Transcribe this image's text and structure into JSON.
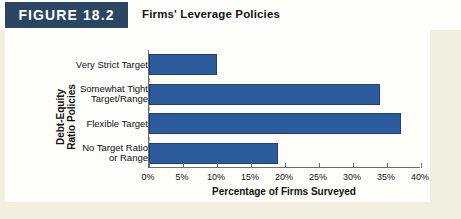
{
  "figure": {
    "tag": "FIGURE 18.2",
    "title": "Firms' Leverage Policies"
  },
  "colors": {
    "bar_fill": "#2c5c9e",
    "bar_stroke": "#21416d",
    "tag_background": "#2b4662",
    "panel_background": "#fffefa",
    "page_background": "#f3efdf",
    "axis_line": "#6d6d6d"
  },
  "chart_data": {
    "type": "bar",
    "orientation": "horizontal",
    "title": "Firms' Leverage Policies",
    "categories": [
      "Very Strict Target",
      "Somewhat Tight Target/Range",
      "Flexible Target",
      "No Target Ratio or Range"
    ],
    "category_lines": [
      [
        "Very Strict Target"
      ],
      [
        "Somewhat Tight",
        "Target/Range"
      ],
      [
        "Flexible Target"
      ],
      [
        "No Target Ratio",
        "or Range"
      ]
    ],
    "values": [
      10,
      34,
      37,
      19
    ],
    "xlabel": "Percentage of Firms Surveyed",
    "ylabel": "Debt-Equity Ratio Policies",
    "ylabel_lines": [
      "Debt-Equity",
      "Ratio Policies"
    ],
    "xlim": [
      0,
      40
    ],
    "xtick_values": [
      0,
      5,
      10,
      15,
      20,
      25,
      30,
      35,
      40
    ],
    "xtick_labels": [
      "0%",
      "5%",
      "10%",
      "15%",
      "20%",
      "25%",
      "30%",
      "35%",
      "40%"
    ],
    "grid": false,
    "legend": false
  }
}
